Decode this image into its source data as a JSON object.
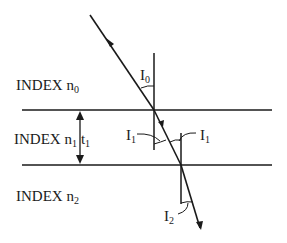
{
  "diagram": {
    "colors": {
      "line": "#1a1a1a",
      "background": "#ffffff"
    },
    "media": [
      {
        "label": "INDEX n",
        "sub": "0",
        "extra": ""
      },
      {
        "label": "INDEX n",
        "sub": "1",
        "extra": "t",
        "extra_sub": "1"
      },
      {
        "label": "INDEX n",
        "sub": "2",
        "extra": ""
      }
    ],
    "angles": [
      {
        "label": "I",
        "sub": "0"
      },
      {
        "label": "I",
        "sub": "1"
      },
      {
        "label": "I",
        "sub": "1"
      },
      {
        "label": "I",
        "sub": "2"
      }
    ]
  }
}
